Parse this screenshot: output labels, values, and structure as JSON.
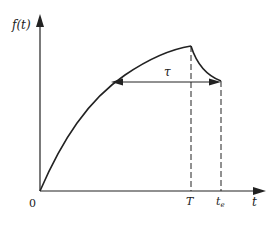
{
  "figure": {
    "y_axis_label": "f(t)",
    "x_axis_label": "t",
    "origin_label": "0",
    "tick_T_label": "T",
    "tick_te_label": "t",
    "tick_te_subscript": "e",
    "interval_label": "τ",
    "colors": {
      "stroke": "#222222",
      "background": "#ffffff"
    }
  }
}
